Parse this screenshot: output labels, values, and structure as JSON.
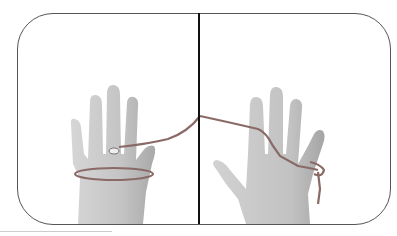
{
  "image": {
    "description": "Two hands demonstrating a string figure; left hand with string looped around palm and ring finger, right hand with string over fingers",
    "colors": {
      "skin": "#c9c9c9",
      "skin_shadow": "#a8a8a8",
      "string": "#8a6a66",
      "frame_border": "#555555",
      "divider": "#111111",
      "background": "#ffffff"
    }
  }
}
